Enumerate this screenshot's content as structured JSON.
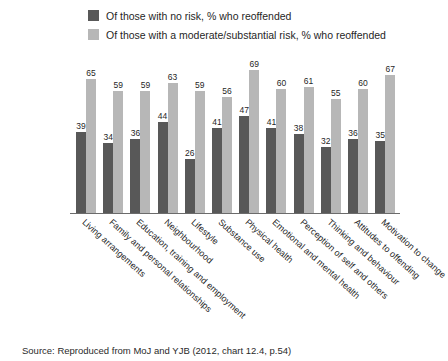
{
  "legend": {
    "position": "top",
    "entries": [
      {
        "label": "Of those with no risk, % who reoffended",
        "color": "#585858",
        "swatch_name": "legend-swatch-no-risk"
      },
      {
        "label": "Of those with a moderate/substantial risk, % who reoffended",
        "color": "#b7b7b7",
        "swatch_name": "legend-swatch-moderate-risk"
      }
    ]
  },
  "source": "Source: Reproduced from MoJ and YJB (2012, chart 12.4, p.54)",
  "chart_data": {
    "type": "bar",
    "title": "",
    "subtitle": "",
    "xlabel": "",
    "ylabel": "",
    "ylim": [
      0,
      75
    ],
    "grid": false,
    "legend_position": "top",
    "categories": [
      "Living arrangements",
      "Family and personal relationships",
      "Education, training and employment",
      "Neighbourhood",
      "Lifestyle",
      "Substance use",
      "Physical health",
      "Emotional and mental health",
      "Perception of self and others",
      "Thinking and behaviour",
      "Attitudes to offending",
      "Motivation to change"
    ],
    "series": [
      {
        "name": "Of those with no risk, % who reoffended",
        "color": "#585858",
        "values": [
          39,
          34,
          36,
          44,
          26,
          41,
          47,
          41,
          38,
          32,
          36,
          35
        ]
      },
      {
        "name": "Of those with a moderate/substantial risk, % who reoffended",
        "color": "#b7b7b7",
        "values": [
          65,
          59,
          59,
          63,
          59,
          56,
          69,
          60,
          61,
          55,
          60,
          67
        ]
      }
    ]
  }
}
